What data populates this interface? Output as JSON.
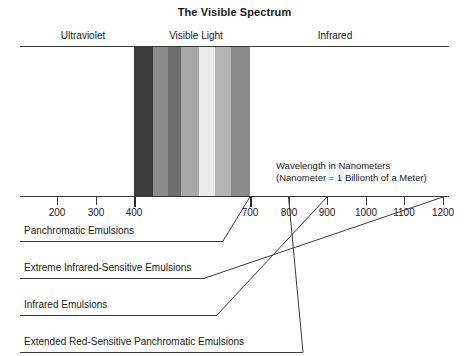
{
  "title": "The Visible Spectrum",
  "regions": [
    {
      "name": "ultraviolet",
      "label": "Ultraviolet"
    },
    {
      "name": "visible-light",
      "label": "Visible Light"
    },
    {
      "name": "infrared",
      "label": "Infrared"
    }
  ],
  "annotation": {
    "line1": "Wavelength in Nanometers",
    "line2": "(Nanometer = 1 Billionth of a Meter)"
  },
  "emulsions": [
    {
      "label": "Panchromatic Emulsions"
    },
    {
      "label": "Extreme Infrared-Sensitive Emulsions"
    },
    {
      "label": "Infrared Emulsions"
    },
    {
      "label": "Extended Red-Sensitive Panchromatic Emulsions"
    }
  ],
  "colors": {
    "line": "#3a3a3a",
    "text": "#1a1a1a",
    "background": "#ffffff"
  },
  "chart_data": {
    "type": "bar",
    "title": "The Visible Spectrum",
    "xlabel": "Wavelength in Nanometers",
    "ylabel": "",
    "xlim": [
      100,
      1250
    ],
    "grid": false,
    "legend": "none",
    "categories": [
      "200",
      "300",
      "400",
      "500",
      "600",
      "700",
      "800",
      "900",
      "1000",
      "1100",
      "1200"
    ],
    "tick_labels": [
      "200",
      "300",
      "400",
      "700",
      "800",
      "900",
      "1000",
      "1100",
      "1200"
    ],
    "tick_values": [
      200,
      300,
      400,
      700,
      800,
      900,
      1000,
      1100,
      1200
    ],
    "spectrum_bands": [
      {
        "name": "violet",
        "start_nm": 400,
        "end_nm": 445,
        "gray": "#3c3c3c"
      },
      {
        "name": "blue",
        "start_nm": 445,
        "end_nm": 485,
        "gray": "#8c8c8c"
      },
      {
        "name": "cyan",
        "start_nm": 485,
        "end_nm": 515,
        "gray": "#6e6e6e"
      },
      {
        "name": "green",
        "start_nm": 515,
        "end_nm": 560,
        "gray": "#a8a8a8"
      },
      {
        "name": "yellow",
        "start_nm": 560,
        "end_nm": 600,
        "gray": "#ebebeb"
      },
      {
        "name": "orange",
        "start_nm": 600,
        "end_nm": 640,
        "gray": "#b4b4b4"
      },
      {
        "name": "red",
        "start_nm": 640,
        "end_nm": 700,
        "gray": "#8a8a8a"
      }
    ],
    "regions": [
      {
        "name": "Ultraviolet",
        "start_nm": 130,
        "end_nm": 400
      },
      {
        "name": "Visible Light",
        "start_nm": 400,
        "end_nm": 700
      },
      {
        "name": "Infrared",
        "start_nm": 700,
        "end_nm": 1250
      }
    ],
    "series": [
      {
        "name": "Panchromatic Emulsions",
        "end_nm": 700
      },
      {
        "name": "Extreme Infrared-Sensitive Emulsions",
        "end_nm": 1200
      },
      {
        "name": "Infrared Emulsions",
        "end_nm": 900
      },
      {
        "name": "Extended Red-Sensitive Panchromatic Emulsions",
        "end_nm": 800
      }
    ]
  }
}
